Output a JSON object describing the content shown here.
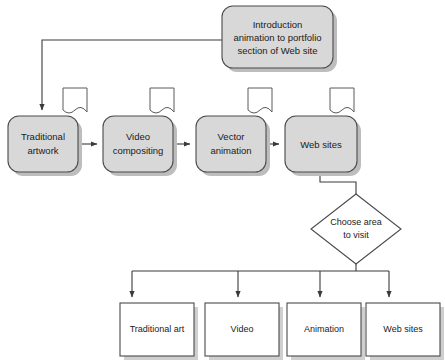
{
  "diagram": {
    "colors": {
      "process_fill": "#d8d8d8",
      "decision_fill": "#ffffff",
      "leaf_fill": "#ffffff",
      "stroke": "#4a4a4a",
      "shadow": "#bdbdbd",
      "background": "#ffffff",
      "text": "#1a1a1a"
    },
    "terminator": {
      "name": "introduction-node",
      "line1": "Introduction",
      "line2": "animation to portfolio",
      "line3": "section of Web site"
    },
    "process_row": [
      {
        "name": "traditional-artwork",
        "line1": "Traditional",
        "line2": "artwork",
        "note_icon": "note-page-icon"
      },
      {
        "name": "video-compositing",
        "line1": "Video",
        "line2": "compositing",
        "note_icon": "note-page-icon"
      },
      {
        "name": "vector-animation",
        "line1": "Vector",
        "line2": "animation",
        "note_icon": "note-page-icon"
      },
      {
        "name": "web-sites",
        "line1": "Web sites",
        "line2": "",
        "note_icon": "note-page-icon"
      }
    ],
    "decision": {
      "name": "choose-area-decision",
      "line1": "Choose area",
      "line2": "to visit"
    },
    "leaf_row": [
      {
        "name": "leaf-traditional-art",
        "label": "Traditional art"
      },
      {
        "name": "leaf-video",
        "label": "Video"
      },
      {
        "name": "leaf-animation",
        "label": "Animation"
      },
      {
        "name": "leaf-web-sites",
        "label": "Web sites"
      }
    ]
  }
}
